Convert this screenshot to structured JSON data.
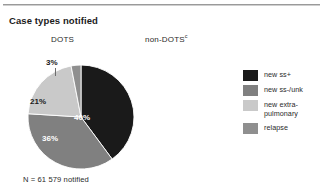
{
  "figure": {
    "title": "Case types notified",
    "columns": [
      {
        "label": "DOTS",
        "footnote": ""
      },
      {
        "label": "non-DOTS",
        "footnote": "c"
      }
    ],
    "caption": "N = 61 579 notified"
  },
  "legend": {
    "items": [
      {
        "label": "new ss+",
        "color": "#1a1a1a"
      },
      {
        "label": "new ss-/unk",
        "color": "#808080"
      },
      {
        "label": "new extra-\npulmonary",
        "color": "#c9c9c9"
      },
      {
        "label": "relapse",
        "color": "#8f8f8f"
      }
    ]
  },
  "chart_data": {
    "type": "pie",
    "title": "Case types notified",
    "subtitle": "DOTS",
    "total_label": "N = 61 579 notified",
    "total": 61579,
    "start_angle": 0,
    "direction": "clockwise",
    "categories": [
      "new ss+",
      "new ss-/unk",
      "new extra-pulmonary",
      "relapse"
    ],
    "values": [
      40,
      36,
      21,
      3
    ],
    "data_labels": [
      "40%",
      "36%",
      "21%",
      "3%"
    ],
    "colors": [
      "#1a1a1a",
      "#808080",
      "#c9c9c9",
      "#8f8f8f"
    ],
    "units": "percent",
    "legend_position": "right"
  }
}
